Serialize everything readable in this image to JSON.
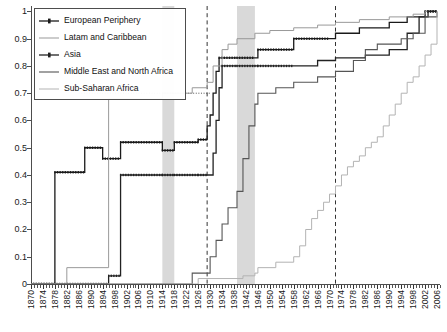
{
  "chart_data": {
    "type": "line",
    "title": "",
    "subtitle": "",
    "xlabel": "",
    "ylabel": "",
    "xlim": [
      1870,
      2007
    ],
    "ylim": [
      0,
      1.02
    ],
    "grid": false,
    "legend_position": "top-left",
    "y_ticks": [
      "0",
      "0.1",
      "0.2",
      "0.3",
      "0.4",
      "0.5",
      "0.6",
      "0.7",
      "0.8",
      "0.9",
      "1"
    ],
    "y_tick_values": [
      0,
      0.1,
      0.2,
      0.3,
      0.4,
      0.5,
      0.6,
      0.7,
      0.8,
      0.9,
      1
    ],
    "x_ticks": [
      "1870",
      "1874",
      "1878",
      "1882",
      "1886",
      "1890",
      "1894",
      "1898",
      "1902",
      "1906",
      "1910",
      "1914",
      "1918",
      "1922",
      "1926",
      "1930",
      "1934",
      "1938",
      "1942",
      "1946",
      "1950",
      "1954",
      "1958",
      "1962",
      "1966",
      "1970",
      "1974",
      "1978",
      "1982",
      "1986",
      "1990",
      "1994",
      "1998",
      "2002",
      "2006"
    ],
    "x_tick_step": 4,
    "x_minor_step": 1,
    "annotations": {
      "shaded_bands": [
        {
          "name": "world-war-one",
          "start": 1914,
          "end": 1918,
          "color": "#d9d9d9"
        },
        {
          "name": "world-war-two",
          "start": 1939,
          "end": 1945,
          "color": "#d9d9d9"
        }
      ],
      "vertical_dashed_lines": [
        {
          "name": "great-depression",
          "x": 1929,
          "color": "#333333"
        },
        {
          "name": "bretton-woods-collapse",
          "x": 1972,
          "color": "#333333"
        }
      ],
      "horizontal_dotted_line": {
        "name": "reference-level",
        "y": 0.7,
        "x_start": 1886,
        "x_end": 1930,
        "color": "#555555"
      }
    },
    "series": [
      {
        "name": "European Periphery",
        "color": "#1a1a1a",
        "width": 1.3,
        "marker": "square-dotted",
        "points": [
          [
            1870,
            0.0
          ],
          [
            1878,
            0.0
          ],
          [
            1878,
            0.41
          ],
          [
            1888,
            0.41
          ],
          [
            1888,
            0.5
          ],
          [
            1894,
            0.5
          ],
          [
            1894,
            0.46
          ],
          [
            1900,
            0.46
          ],
          [
            1900,
            0.52
          ],
          [
            1914,
            0.52
          ],
          [
            1914,
            0.49
          ],
          [
            1918,
            0.49
          ],
          [
            1918,
            0.52
          ],
          [
            1926,
            0.52
          ],
          [
            1926,
            0.53
          ],
          [
            1929,
            0.53
          ],
          [
            1929,
            0.58
          ],
          [
            1930,
            0.62
          ],
          [
            1931,
            0.7
          ],
          [
            1932,
            0.78
          ],
          [
            1933,
            0.83
          ],
          [
            1939,
            0.83
          ],
          [
            1945,
            0.83
          ],
          [
            1946,
            0.86
          ],
          [
            1958,
            0.86
          ],
          [
            1958,
            0.9
          ],
          [
            1970,
            0.9
          ],
          [
            1972,
            0.92
          ],
          [
            1980,
            0.94
          ],
          [
            1990,
            0.96
          ],
          [
            1996,
            0.98
          ],
          [
            2002,
            1.0
          ],
          [
            2006,
            1.0
          ]
        ]
      },
      {
        "name": "Latam and Caribbean",
        "color": "#999999",
        "width": 1.0,
        "marker": "none",
        "points": [
          [
            1870,
            0.0
          ],
          [
            1882,
            0.0
          ],
          [
            1882,
            0.06
          ],
          [
            1896,
            0.06
          ],
          [
            1896,
            0.68
          ],
          [
            1914,
            0.68
          ],
          [
            1914,
            0.7
          ],
          [
            1922,
            0.7
          ],
          [
            1924,
            0.72
          ],
          [
            1929,
            0.74
          ],
          [
            1931,
            0.8
          ],
          [
            1934,
            0.86
          ],
          [
            1936,
            0.88
          ],
          [
            1939,
            0.9
          ],
          [
            1945,
            0.92
          ],
          [
            1950,
            0.93
          ],
          [
            1958,
            0.94
          ],
          [
            1966,
            0.95
          ],
          [
            1972,
            0.96
          ],
          [
            1980,
            0.97
          ],
          [
            1990,
            0.98
          ],
          [
            1998,
            0.99
          ],
          [
            2002,
            1.0
          ],
          [
            2006,
            1.0
          ]
        ]
      },
      {
        "name": "Asia",
        "color": "#222222",
        "width": 1.3,
        "marker": "square-dotted",
        "points": [
          [
            1870,
            0.0
          ],
          [
            1896,
            0.0
          ],
          [
            1896,
            0.03
          ],
          [
            1900,
            0.03
          ],
          [
            1900,
            0.4
          ],
          [
            1914,
            0.4
          ],
          [
            1918,
            0.4
          ],
          [
            1926,
            0.4
          ],
          [
            1929,
            0.4
          ],
          [
            1931,
            0.48
          ],
          [
            1932,
            0.6
          ],
          [
            1933,
            0.72
          ],
          [
            1934,
            0.8
          ],
          [
            1939,
            0.8
          ],
          [
            1945,
            0.8
          ],
          [
            1946,
            0.8
          ],
          [
            1958,
            0.8
          ],
          [
            1966,
            0.82
          ],
          [
            1972,
            0.83
          ],
          [
            1982,
            0.84
          ],
          [
            1990,
            0.86
          ],
          [
            1996,
            0.92
          ],
          [
            2000,
            0.98
          ],
          [
            2003,
            1.0
          ],
          [
            2006,
            1.0
          ]
        ]
      },
      {
        "name": "Middle East and North Africa",
        "color": "#555555",
        "width": 1.1,
        "marker": "none",
        "points": [
          [
            1870,
            0.0
          ],
          [
            1924,
            0.0
          ],
          [
            1924,
            0.04
          ],
          [
            1929,
            0.04
          ],
          [
            1930,
            0.1
          ],
          [
            1932,
            0.16
          ],
          [
            1934,
            0.22
          ],
          [
            1936,
            0.28
          ],
          [
            1939,
            0.34
          ],
          [
            1941,
            0.46
          ],
          [
            1943,
            0.58
          ],
          [
            1945,
            0.66
          ],
          [
            1946,
            0.7
          ],
          [
            1952,
            0.72
          ],
          [
            1958,
            0.74
          ],
          [
            1966,
            0.76
          ],
          [
            1972,
            0.78
          ],
          [
            1978,
            0.82
          ],
          [
            1982,
            0.86
          ],
          [
            1986,
            0.88
          ],
          [
            1994,
            0.9
          ],
          [
            1998,
            0.92
          ],
          [
            2002,
            0.98
          ],
          [
            2006,
            1.0
          ]
        ]
      },
      {
        "name": "Sub-Saharan Africa",
        "color": "#b3b3b3",
        "width": 1.0,
        "marker": "none",
        "points": [
          [
            1870,
            0.0
          ],
          [
            1926,
            0.0
          ],
          [
            1926,
            0.02
          ],
          [
            1939,
            0.02
          ],
          [
            1941,
            0.03
          ],
          [
            1945,
            0.04
          ],
          [
            1946,
            0.06
          ],
          [
            1952,
            0.08
          ],
          [
            1958,
            0.1
          ],
          [
            1960,
            0.14
          ],
          [
            1962,
            0.2
          ],
          [
            1964,
            0.24
          ],
          [
            1966,
            0.27
          ],
          [
            1968,
            0.3
          ],
          [
            1970,
            0.33
          ],
          [
            1972,
            0.36
          ],
          [
            1974,
            0.4
          ],
          [
            1976,
            0.43
          ],
          [
            1978,
            0.45
          ],
          [
            1980,
            0.47
          ],
          [
            1982,
            0.5
          ],
          [
            1984,
            0.52
          ],
          [
            1986,
            0.54
          ],
          [
            1988,
            0.58
          ],
          [
            1990,
            0.62
          ],
          [
            1992,
            0.66
          ],
          [
            1994,
            0.7
          ],
          [
            1996,
            0.74
          ],
          [
            1998,
            0.76
          ],
          [
            2000,
            0.8
          ],
          [
            2002,
            0.84
          ],
          [
            2004,
            0.88
          ],
          [
            2006,
            1.0
          ]
        ]
      }
    ]
  },
  "legend": {
    "items": [
      {
        "label": "European Periphery",
        "icon": "line-marker-swatch"
      },
      {
        "label": "Latam and Caribbean",
        "icon": "line-swatch"
      },
      {
        "label": "Asia",
        "icon": "line-marker-swatch"
      },
      {
        "label": "Middle East and North Africa",
        "icon": "line-swatch"
      },
      {
        "label": "Sub-Saharan Africa",
        "icon": "line-swatch"
      }
    ]
  }
}
